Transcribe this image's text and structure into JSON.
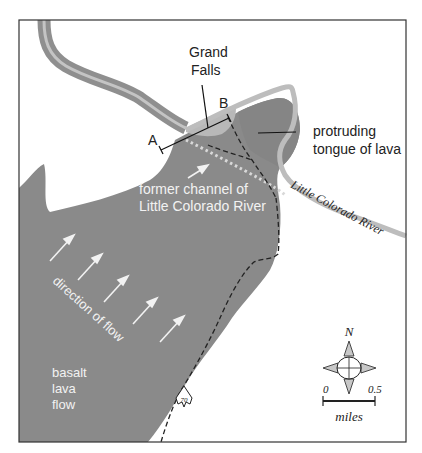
{
  "map": {
    "title_labels": {
      "grand_falls_line1": "Grand",
      "grand_falls_line2": "Falls",
      "point_a": "A",
      "point_b": "B",
      "protruding_line1": "protruding",
      "protruding_line2": "tongue of lava",
      "former_channel_line1": "former channel of",
      "former_channel_line2": "Little Colorado River",
      "river_label": "Little Colorado River",
      "direction_of_flow": "direction of flow",
      "basalt_line1": "basalt",
      "basalt_line2": "lava",
      "basalt_line3": "flow",
      "route_number": "70"
    },
    "compass": {
      "north_label": "N"
    },
    "scale_bar": {
      "start": "0",
      "end": "0.5",
      "unit": "miles"
    },
    "colors": {
      "lava": "#8a8a8a",
      "lava_tongue": "#858585",
      "river_outer": "#8f8f8f",
      "river_inner": "#c4c4c4",
      "river_light": "#bdbdbd",
      "falls_pool": "#b8b8b8",
      "frame": "#333333",
      "text": "#222222",
      "text_on_lava": "#f2f2f2"
    }
  }
}
